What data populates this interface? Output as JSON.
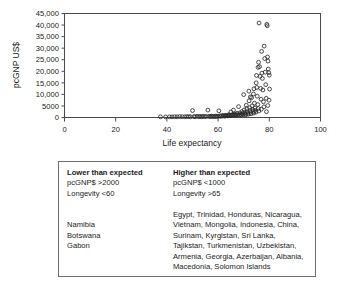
{
  "chart_data": {
    "type": "scatter",
    "title": "",
    "xlabel": "Life expectancy",
    "ylabel": "pcGNP US$",
    "xlim": [
      0,
      100
    ],
    "ylim": [
      0,
      45000
    ],
    "xticks": [
      "0",
      "20",
      "40",
      "60",
      "80",
      "100"
    ],
    "xtick_values": [
      0,
      20,
      40,
      60,
      80,
      100
    ],
    "yticks": [
      "0",
      "5000",
      "10,000",
      "15,000",
      "20,000",
      "25,000",
      "30,000",
      "35,000",
      "40,000",
      "45,000"
    ],
    "ytick_values": [
      0,
      5000,
      10000,
      15000,
      20000,
      25000,
      30000,
      35000,
      40000,
      45000
    ],
    "grid": false,
    "legend": "none",
    "marker": "open-circle",
    "points": [
      [
        37.5,
        300
      ],
      [
        39.5,
        250
      ],
      [
        41.0,
        300
      ],
      [
        42.0,
        280
      ],
      [
        43.0,
        350
      ],
      [
        44.0,
        300
      ],
      [
        45.0,
        400
      ],
      [
        46.0,
        350
      ],
      [
        47.0,
        300
      ],
      [
        47.8,
        420
      ],
      [
        48.5,
        380
      ],
      [
        49.2,
        300
      ],
      [
        50.0,
        3000
      ],
      [
        50.5,
        400
      ],
      [
        51.0,
        350
      ],
      [
        51.8,
        500
      ],
      [
        52.5,
        400
      ],
      [
        53.0,
        450
      ],
      [
        53.6,
        350
      ],
      [
        54.2,
        500
      ],
      [
        54.8,
        400
      ],
      [
        55.4,
        450
      ],
      [
        56.0,
        3200
      ],
      [
        56.4,
        500
      ],
      [
        56.9,
        400
      ],
      [
        57.3,
        600
      ],
      [
        57.8,
        450
      ],
      [
        58.2,
        500
      ],
      [
        58.7,
        420
      ],
      [
        59.1,
        600
      ],
      [
        59.5,
        500
      ],
      [
        59.9,
        550
      ],
      [
        60.3,
        2900
      ],
      [
        60.6,
        700
      ],
      [
        61.0,
        500
      ],
      [
        61.4,
        800
      ],
      [
        61.8,
        600
      ],
      [
        62.1,
        900
      ],
      [
        62.5,
        700
      ],
      [
        62.8,
        600
      ],
      [
        63.1,
        1000
      ],
      [
        63.5,
        800
      ],
      [
        63.8,
        700
      ],
      [
        64.1,
        1200
      ],
      [
        64.4,
        900
      ],
      [
        64.7,
        800
      ],
      [
        65.0,
        2400
      ],
      [
        65.2,
        1100
      ],
      [
        65.5,
        900
      ],
      [
        65.8,
        1300
      ],
      [
        66.0,
        3200
      ],
      [
        66.3,
        1000
      ],
      [
        66.6,
        1500
      ],
      [
        66.9,
        1100
      ],
      [
        67.1,
        900
      ],
      [
        67.4,
        1800
      ],
      [
        67.7,
        1200
      ],
      [
        68.0,
        4700
      ],
      [
        68.2,
        1000
      ],
      [
        68.5,
        2000
      ],
      [
        68.8,
        1400
      ],
      [
        69.0,
        1100
      ],
      [
        69.3,
        2600
      ],
      [
        69.5,
        1700
      ],
      [
        69.8,
        1200
      ],
      [
        70.0,
        9900
      ],
      [
        70.2,
        3300
      ],
      [
        70.4,
        2100
      ],
      [
        70.6,
        1500
      ],
      [
        70.8,
        1200
      ],
      [
        71.0,
        5300
      ],
      [
        71.2,
        3800
      ],
      [
        71.4,
        2500
      ],
      [
        71.6,
        1800
      ],
      [
        71.8,
        1400
      ],
      [
        72.0,
        11400
      ],
      [
        72.1,
        7200
      ],
      [
        72.3,
        4300
      ],
      [
        72.5,
        3000
      ],
      [
        72.7,
        2200
      ],
      [
        72.9,
        1600
      ],
      [
        73.1,
        8600
      ],
      [
        73.3,
        5000
      ],
      [
        73.5,
        3500
      ],
      [
        73.7,
        2600
      ],
      [
        73.9,
        1900
      ],
      [
        74.0,
        12400
      ],
      [
        74.2,
        6200
      ],
      [
        74.4,
        4100
      ],
      [
        74.6,
        3100
      ],
      [
        74.8,
        2300
      ],
      [
        75.0,
        18200
      ],
      [
        75.1,
        13000
      ],
      [
        75.3,
        9200
      ],
      [
        75.5,
        5600
      ],
      [
        75.7,
        3900
      ],
      [
        75.9,
        2800
      ],
      [
        76.0,
        40900
      ],
      [
        76.2,
        22000
      ],
      [
        76.4,
        17800
      ],
      [
        76.6,
        12600
      ],
      [
        76.8,
        7900
      ],
      [
        77.0,
        28600
      ],
      [
        77.1,
        19200
      ],
      [
        77.3,
        16900
      ],
      [
        77.5,
        11900
      ],
      [
        77.7,
        6800
      ],
      [
        78.0,
        30900
      ],
      [
        78.2,
        25500
      ],
      [
        78.4,
        19600
      ],
      [
        78.6,
        14200
      ],
      [
        78.8,
        8300
      ],
      [
        79.0,
        40300
      ],
      [
        79.2,
        39700
      ],
      [
        79.3,
        26200
      ],
      [
        79.5,
        24400
      ],
      [
        79.6,
        21000
      ],
      [
        79.8,
        19400
      ],
      [
        80.0,
        18300
      ],
      [
        80.1,
        12300
      ],
      [
        79.9,
        7500
      ],
      [
        79.4,
        5200
      ],
      [
        78.9,
        2500
      ],
      [
        77.9,
        4600
      ],
      [
        76.9,
        3600
      ],
      [
        75.8,
        23900
      ],
      [
        75.6,
        21700
      ],
      [
        74.9,
        15000
      ],
      [
        73.8,
        10200
      ],
      [
        72.6,
        8900
      ]
    ]
  },
  "table": {
    "columns": [
      {
        "header": "Lower than expected",
        "criteria": [
          "pcGNP$ >2000",
          "Longevity <60"
        ],
        "countries": [
          "Namibia",
          "Botswana",
          "Gabon"
        ]
      },
      {
        "header": "Higher than expected",
        "criteria": [
          "pcGNP$ <1000",
          "Longevity >65"
        ],
        "countries": [
          "Egypt, Trinidad, Honduras, Nicaragua,",
          "Vietnam, Mongolia, Indonesia, China,",
          "Surinam, Kyrgistan, Sri Lanka,",
          "Tajikstan, Turkmenistan, Uzbekistan,",
          "Armenia, Georgia, Azerbaijan, Albania,",
          "Macedonia, Solomon Islands"
        ]
      }
    ]
  },
  "colors": {
    "marker_stroke": "#2b2b2b",
    "axis": "#4a4a4a",
    "text": "#1a1a1a",
    "table_border": "#6d6d6d",
    "background": "#ffffff"
  }
}
